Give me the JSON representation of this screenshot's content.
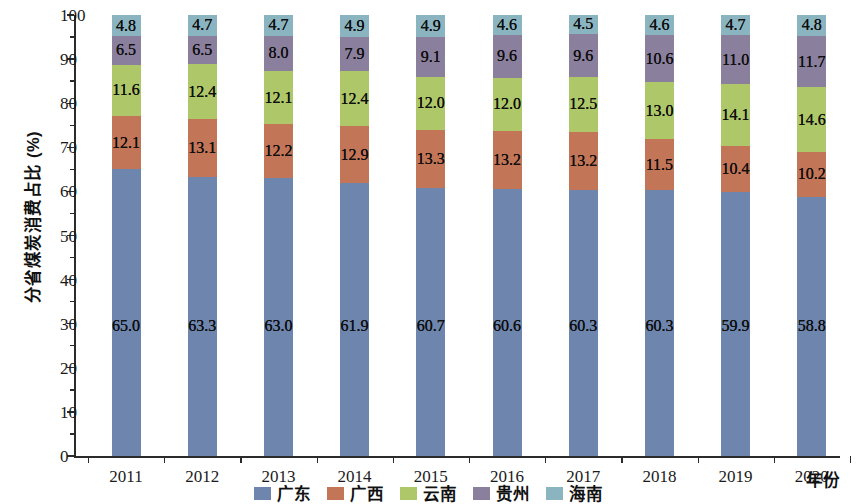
{
  "chart_data": {
    "type": "bar",
    "stacked": true,
    "stack_total": 100,
    "title": "",
    "xlabel": "年份",
    "ylabel": "分省煤炭消费占比 (%)",
    "ylim": [
      0,
      100
    ],
    "ytick_step": 10,
    "grid": false,
    "legend_position": "bottom",
    "categories": [
      "2011",
      "2012",
      "2013",
      "2014",
      "2015",
      "2016",
      "2017",
      "2018",
      "2019",
      "2020"
    ],
    "series": [
      {
        "name": "广东",
        "color": "#6e86ae",
        "values": [
          65.0,
          63.3,
          63.0,
          61.9,
          60.7,
          60.6,
          60.3,
          60.3,
          59.9,
          58.8
        ],
        "labels": [
          "65.0",
          "63.3",
          "63.0",
          "61.9",
          "60.7",
          "60.6",
          "60.3",
          "60.3",
          "59.9",
          "58.8"
        ]
      },
      {
        "name": "广西",
        "color": "#c37558",
        "values": [
          12.1,
          13.1,
          12.2,
          12.9,
          13.3,
          13.2,
          13.2,
          11.5,
          10.4,
          10.2
        ],
        "labels": [
          "12.1",
          "13.1",
          "12.2",
          "12.9",
          "13.3",
          "13.2",
          "13.2",
          "11.5",
          "10.4",
          "10.2"
        ]
      },
      {
        "name": "云南",
        "color": "#aec768",
        "values": [
          11.6,
          12.4,
          12.1,
          12.4,
          12.0,
          12.0,
          12.5,
          13.0,
          14.1,
          14.6
        ],
        "labels": [
          "11.6",
          "12.4",
          "12.1",
          "12.4",
          "12.0",
          "12.0",
          "12.5",
          "13.0",
          "14.1",
          "14.6"
        ]
      },
      {
        "name": "贵州",
        "color": "#8a7f9c",
        "values": [
          6.5,
          6.5,
          8.0,
          7.9,
          9.1,
          9.6,
          9.6,
          10.6,
          11.0,
          11.7
        ],
        "labels": [
          "6.5",
          "6.5",
          "8.0",
          "7.9",
          "9.1",
          "9.6",
          "9.6",
          "10.6",
          "11.0",
          "11.7"
        ]
      },
      {
        "name": "海南",
        "color": "#8ab4c0",
        "values": [
          4.8,
          4.7,
          4.7,
          4.9,
          4.9,
          4.6,
          4.5,
          4.6,
          4.7,
          4.8
        ],
        "labels": [
          "4.8",
          "4.7",
          "4.7",
          "4.9",
          "4.9",
          "4.6",
          "4.5",
          "4.6",
          "4.7",
          "4.8"
        ]
      }
    ],
    "ytick_labels": [
      "0",
      "10",
      "20",
      "30",
      "40",
      "50",
      "60",
      "70",
      "80",
      "90",
      "100"
    ],
    "ytick_values": [
      0,
      10,
      20,
      30,
      40,
      50,
      60,
      70,
      80,
      90,
      100
    ]
  }
}
